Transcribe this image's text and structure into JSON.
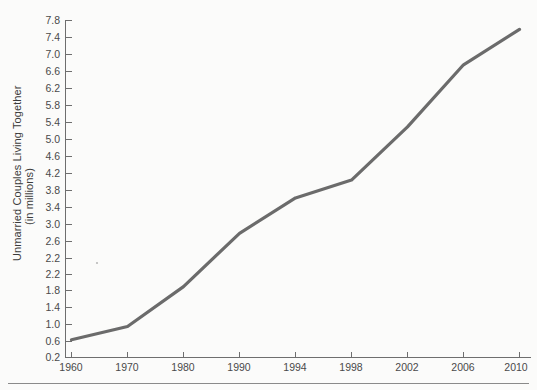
{
  "chart_data": {
    "type": "line",
    "title": "",
    "xlabel": "",
    "ylabel": "Unmarried Couples Living Together (in millions)",
    "ylabel_line1": "Unmarried Couples Living Together",
    "ylabel_line2": "(in millions)",
    "categories": [
      "1960",
      "1970",
      "1980",
      "1990",
      "1994",
      "1998",
      "2002",
      "2006",
      "2010"
    ],
    "x": [
      1960,
      1970,
      1980,
      1990,
      1994,
      1998,
      2002,
      2006,
      2010
    ],
    "values": [
      0.6,
      0.9,
      1.8,
      3.0,
      3.8,
      4.2,
      5.4,
      6.8,
      7.6
    ],
    "xticklabels": [
      "1960",
      "1970",
      "1980",
      "1990",
      "1994",
      "1998",
      "2002",
      "2006",
      "2010"
    ],
    "yticklabels": [
      "7.8",
      "7.4",
      "7.0",
      "6.6",
      "6.2",
      "5.8",
      "5.4",
      "5.0",
      "4.6",
      "4.2",
      "3.8",
      "3.4",
      "3.0",
      "2.6",
      "2.2",
      "1.8",
      "1.4",
      "1.0",
      "0.6",
      "0.2"
    ],
    "yticks": [
      7.8,
      7.4,
      7.0,
      6.6,
      6.2,
      5.8,
      5.4,
      5.0,
      4.6,
      4.2,
      3.8,
      3.4,
      3.0,
      2.6,
      2.2,
      1.8,
      1.4,
      1.0,
      0.6,
      0.2
    ],
    "ylim": [
      0.2,
      7.8
    ],
    "ytick_step": 0.4,
    "grid": false,
    "legend": false,
    "legend_position": "none",
    "series": [
      {
        "name": "Unmarried Couples Living Together (in millions)",
        "values": [
          0.6,
          0.9,
          1.8,
          3.0,
          3.8,
          4.2,
          5.4,
          6.8,
          7.6
        ],
        "color": "#6b6b6b"
      }
    ],
    "x_axis_spacing": "categorical-even",
    "annotations": []
  },
  "colors": {
    "background": "#fbfbfa",
    "line": "#6b6b6b",
    "axis": "#6e6e6e",
    "tick_text": "#4a4a4a",
    "label_text": "#3b3b3b",
    "footer_rule": "#8a8a8a"
  }
}
